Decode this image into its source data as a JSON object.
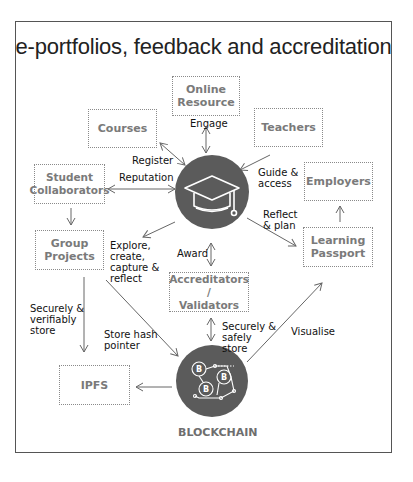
{
  "title": "e-portfolios, feedback and accreditation",
  "nodes": {
    "online_resource": "Online\nResource",
    "courses": "Courses",
    "teachers": "Teachers",
    "student_collaborators": "Student\nCollaborators",
    "employers": "Employers",
    "group_projects": "Group\nProjects",
    "learning_passport": "Learning\nPassport",
    "accreditators": "Accreditators /\nValidators",
    "ipfs": "IPFS",
    "blockchain": "BLOCKCHAIN"
  },
  "edges": {
    "engage": "Engage",
    "register": "Register",
    "reputation": "Reputation",
    "guide_access": "Guide &\naccess",
    "reflect_plan": "Reflect\n& plan",
    "explore": "Explore,\ncreate,\ncapture &\nreflect",
    "award": "Award",
    "securely_verifiably": "Securely &\nverifiably\nstore",
    "store_hash": "Store hash\npointer",
    "securely_safely": "Securely &\nsafely\nstore",
    "visualise": "Visualise"
  },
  "icons": {
    "hub": "graduation-cap-icon",
    "chain": "bitcoin-network-icon"
  },
  "colors": {
    "circle": "#5b5b5b",
    "box_border": "#8a8a8a",
    "box_text": "#7a7a7a",
    "arrow": "#666666"
  }
}
